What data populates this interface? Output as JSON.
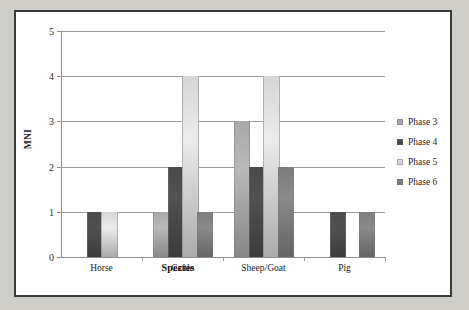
{
  "chart_data": {
    "type": "bar",
    "title": "",
    "xlabel": "Species",
    "ylabel": "MNI",
    "categories": [
      "Horse",
      "Cattle",
      "Sheep/Goat",
      "Pig"
    ],
    "series": [
      {
        "name": "Phase 3",
        "color": "#a8a8a8",
        "values": [
          0,
          1,
          3,
          0
        ]
      },
      {
        "name": "Phase 4",
        "color": "#4a4a4a",
        "values": [
          1,
          2,
          2,
          1
        ]
      },
      {
        "name": "Phase 5",
        "color": "#d6d6d6",
        "values": [
          1,
          4,
          4,
          0
        ]
      },
      {
        "name": "Phase 6",
        "color": "#7d7d7d",
        "values": [
          0,
          1,
          2,
          1
        ]
      }
    ],
    "ylim": [
      0,
      5
    ],
    "yticks": [
      "0",
      "1",
      "2",
      "3",
      "4",
      "5"
    ],
    "grid": true,
    "legend_position": "right"
  },
  "legend": {
    "items": [
      {
        "label": "Phase 3"
      },
      {
        "label": "Phase 4"
      },
      {
        "label": "Phase 5"
      },
      {
        "label": "Phase 6"
      }
    ]
  },
  "axes": {
    "y_title": "MNI",
    "x_title": "Species"
  }
}
